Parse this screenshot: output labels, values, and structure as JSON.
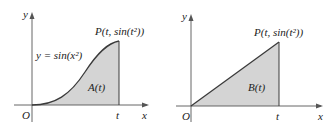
{
  "figures": [
    {
      "id": "left",
      "y_axis_label": "y",
      "x_axis_label": "x",
      "origin_label": "O",
      "t_label": "t",
      "point_label": "P(t, sin(t²))",
      "curve_label": "y = sin(x²)",
      "region_label": "A(t)",
      "shape": "curve"
    },
    {
      "id": "right",
      "y_axis_label": "y",
      "x_axis_label": "x",
      "origin_label": "O",
      "t_label": "t",
      "point_label": "P(t, sin(t²))",
      "region_label": "B(t)",
      "shape": "triangle"
    }
  ],
  "colors": {
    "fill": "#d4d4d4",
    "curve": "#3a3a3a",
    "axis": "#555555"
  }
}
